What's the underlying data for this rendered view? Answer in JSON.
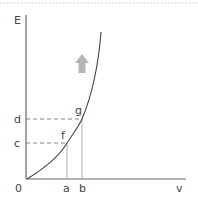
{
  "diagram": {
    "type": "graph",
    "axes": {
      "y_label": "E",
      "x_label": "v",
      "origin_label": "0"
    },
    "points": [
      {
        "name": "f",
        "x_label": "a",
        "y_label": "c"
      },
      {
        "name": "g",
        "x_label": "b",
        "y_label": "d"
      }
    ],
    "labels": {
      "E": "E",
      "v": "v",
      "origin": "0",
      "a": "a",
      "b": "b",
      "c": "c",
      "d": "d",
      "f": "f",
      "g": "g"
    },
    "arrow": {
      "direction": "up",
      "color": "#b0b0b0"
    },
    "colors": {
      "axis": "#555555",
      "curve": "#444444",
      "dashed": "#777777",
      "border_dots": "#bbbbbb"
    }
  }
}
